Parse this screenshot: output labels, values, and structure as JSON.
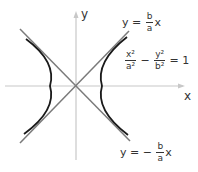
{
  "figure": {
    "axes": {
      "x_label": "x",
      "y_label": "y",
      "origin_px": [
        76,
        86
      ],
      "axis_color": "#c8c8c8"
    },
    "asymptotes": [
      {
        "label_lhs": "y =",
        "label_num": "b",
        "label_den": "a",
        "label_rhs": "x",
        "slope_sign": "+",
        "color": "#7a7a7a"
      },
      {
        "label_lhs": "y = −",
        "label_num": "b",
        "label_den": "a",
        "label_rhs": "x",
        "slope_sign": "-",
        "color": "#7a7a7a"
      }
    ],
    "equation": {
      "t1_num": "x²",
      "t1_den": "a²",
      "op": "−",
      "t2_num": "y²",
      "t2_den": "b²",
      "rhs": "= 1"
    },
    "curve_color": "#1a1a1a"
  }
}
